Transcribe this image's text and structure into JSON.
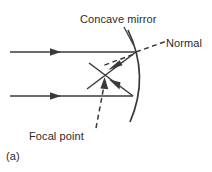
{
  "figure": {
    "panel_label": "(a)",
    "caption_labels": {
      "mirror": "Concave mirror",
      "normal": "Normal",
      "focal_point": "Focal point"
    },
    "colors": {
      "line": "#3a3a3a",
      "text": "#2b2b2b",
      "background": "#ffffff"
    }
  },
  "diagram_data": {
    "type": "optics-ray-diagram",
    "subject": "Concave mirror reflecting parallel rays through the focal point",
    "elements": [
      {
        "name": "incident-ray-upper",
        "kind": "solid-ray",
        "from": [
          10,
          52
        ],
        "to": [
          136,
          52
        ],
        "arrow_at": [
          58,
          52
        ],
        "direction": "right"
      },
      {
        "name": "incident-ray-lower",
        "kind": "solid-ray",
        "from": [
          10,
          96
        ],
        "to": [
          133,
          96
        ],
        "arrow_at": [
          58,
          96
        ],
        "direction": "right"
      },
      {
        "name": "concave-mirror-arc",
        "kind": "arc",
        "start": [
          128,
          30
        ],
        "apex": [
          142,
          76
        ],
        "end": [
          130,
          122
        ],
        "concavity": "opens-left"
      },
      {
        "name": "reflected-ray-upper",
        "kind": "solid-ray",
        "from": [
          136,
          52
        ],
        "to": [
          88,
          88
        ],
        "arrow_at": [
          112,
          70
        ],
        "direction": "down-left"
      },
      {
        "name": "reflected-ray-lower",
        "kind": "solid-ray",
        "from": [
          133,
          96
        ],
        "to": [
          90,
          64
        ],
        "arrow_at": [
          113,
          81
        ],
        "direction": "up-left"
      },
      {
        "name": "normal-line",
        "kind": "dashed-line",
        "from": [
          136,
          52
        ],
        "to": [
          167,
          41
        ]
      },
      {
        "name": "normal-extension-dashed",
        "kind": "dashed-line",
        "from": [
          134,
          54
        ],
        "to": [
          103,
          66
        ]
      },
      {
        "name": "focal-point-leader",
        "kind": "dashed-leader",
        "from": [
          96,
          128
        ],
        "to": [
          104,
          83
        ],
        "arrow_at": [
          104,
          83
        ],
        "direction": "up"
      },
      {
        "name": "mirror-label-leader",
        "kind": "solid-leader",
        "from": [
          124,
          28
        ],
        "to": [
          133,
          44
        ]
      }
    ],
    "focal_point": [
      104,
      78
    ]
  }
}
